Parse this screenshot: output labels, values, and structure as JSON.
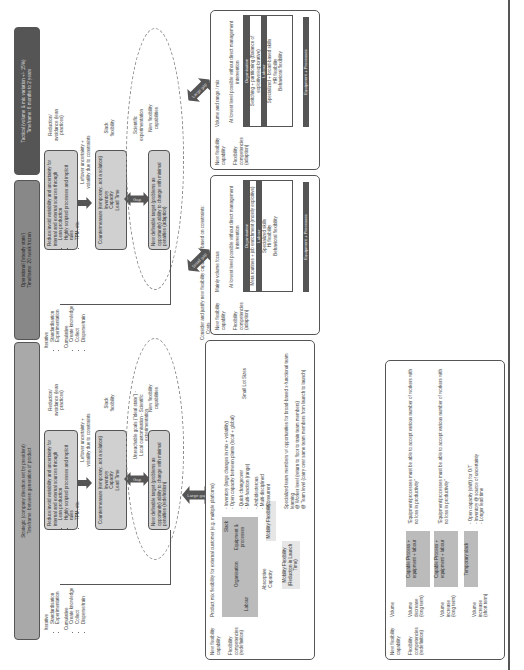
{
  "bands": {
    "strategic": "Strategic (company direction set by president)\nTimeframe: between generation of product",
    "operational": "Operational ('steady state')\nTimeframe: 20 week frozen",
    "tactical": "Tactical (volume & mix variation +/- 15%)\nTimeframe: 6 months to 2 years"
  },
  "strategic_flow": {
    "reduce_box": {
      "title": "Reduce/avoid variability and uncertainty for internal and external sources through",
      "items": [
        "Lean production",
        "Highly scripted processes and implicit rules",
        "TPM, etc."
      ]
    },
    "reduction_label": "Reduction/ avoidance (lean practices)",
    "leftover_label": "Leftover uncertainty + volatility due to constraints",
    "counter_box": {
      "title": "Countermeasure (temporary...not a solution)",
      "items": [
        "Inventory",
        "Capacity",
        "Lead Time"
      ]
    },
    "slack_label": "Slack flexibility",
    "gap_label": "Gap",
    "unreachable_label": "Unreachable goals (\"ideal state\") - Local customisation - Scientific experimentation",
    "new_target_box": "New definable target (problems as opportunity) ability to change with minimal penalties (redefinition)",
    "new_capabilities_label": "New flexibility capabilities",
    "iterative_label": {
      "title": "Iterative",
      "items": [
        "Standardisation",
        "Experimentation"
      ]
    },
    "cumulative_label": {
      "title": "Cumulative",
      "items": [
        "Create knowledge",
        "Collect",
        "Disperse/train"
      ]
    }
  },
  "operational_flow": {
    "reduce_box": {
      "title": "Reduce/avoid variability and uncertainty for internal and external sources through",
      "items": [
        "Lean production",
        "Highly scripted processes and implicit rules",
        "TPM, etc."
      ]
    },
    "reduction_label": "Reduction/ avoidance (lean practices)",
    "leftover_label": "Leftover uncertainty + volatility due to constraints",
    "counter_box": {
      "title": "Countermeasure (temporary...not a solution)",
      "items": [
        "Inventory",
        "Capacity",
        "Lead Time"
      ]
    },
    "slack_label": "Slack flexibility",
    "gap_label": "Gap",
    "scientific_label": "Scientific experimentation",
    "new_target_box": "New definable target (problems as opportunity) ability to change with minimal penalties (adaption)",
    "new_capabilities_label": "New flexibility capabilities",
    "iterative_label": {
      "title": "Iterative",
      "items": [
        "Standardisation",
        "Experimentation"
      ]
    },
    "cumulative_label": {
      "title": "Cumulative",
      "items": [
        "Create knowledge",
        "Collect",
        "Disperse/train"
      ]
    }
  },
  "consider": {
    "title": "Consider and justify new flexibility capabilities based on constraints:",
    "items": [
      "Costs",
      "Resources",
      "Production Performance",
      "Timing"
    ]
  },
  "gaps": {
    "large1": "Large gap",
    "small": "Small gap",
    "large2": "Large gap"
  },
  "strategic_panel": {
    "cap_label": "New flexibility capability",
    "comp_label": "Flexibility competencies (redefinition)",
    "heading": "Product mix flexibility for external customer (e.g. multiple platforms)",
    "slack": "Slack",
    "equipment": "Equipment & processes",
    "organisation": "Organisation",
    "labour": "Labour",
    "absorptive": "Absorptive Capacity",
    "mobility1": "Mobility Flexibility",
    "mobility2": "Mobility Flexibility (Reduction in Launch Time)",
    "slack_items": [
      "- Inventory (large changes in mix + volatility)",
      "- Open capacity between plants (local + global)"
    ],
    "equip_items": [
      "- Quick changeover",
      "- Multi-function (range)"
    ],
    "small_lot": "Small Lot Sizes",
    "org_items": [
      "- Ambidexterous",
      "- Multi-disciplined",
      "- Consurrent"
    ],
    "labour_text": [
      "Specialized team members w/ opportunities for broad-based x-functional team learning",
      "@ Worker level (return to floor to train team members)",
      "@ Team level (carry over same team members from launch to launch)"
    ]
  },
  "operational_panel": {
    "cap_label": "New flexibility capability",
    "comp_label": "Flexibility competencies (adaption)",
    "heading": "Mainly volume focus",
    "intro": "At lowest level possible without direct management intervention",
    "org_hdr": "Organisation",
    "org_text": "Meta routines + job enrichment (mostly exploitive)",
    "lab_hdr": "Labour",
    "lab_text": [
      "Specialized skills",
      "Hi flexibility",
      "Behavioral flexibility"
    ],
    "bottom": "Equipment + Processes"
  },
  "tactical_panel": {
    "cap_label": "New flexibility capability",
    "comp_label": "Flexibility competencies (adaption)",
    "heading": "Volume and range / mix",
    "intro": "At lowest level possible without direct management intervention",
    "org_hdr": "Organisation",
    "org_text": "Switching + partitioning (Balance of exploitive/explorative)",
    "lab_hdr": "Labour",
    "lab_text": [
      "Specialized + broad-based skills",
      "HR flexibility",
      "Behavioral flexibility"
    ],
    "bottom": "Equipment + Processes"
  },
  "volume_panel": {
    "cap_label": "New flexibility capability",
    "comp_label": "Flexibility competencies (redefinition)",
    "heading": "Volume",
    "rows": [
      {
        "label": "Volume decrease (long term)",
        "box": "Capable Process + equipment + labour",
        "quote": "\"Equipment/processes must be able to accept various number of workers with no loss in productivity\""
      },
      {
        "label": "Volume increase (long term)",
        "box": "Capable Process + equipment + labour",
        "quote": "\"Equipment/processes must be able to accept various number of workers with no loss in productivity\""
      },
      {
        "label": "Volume increase (short term)",
        "box": "Temporary slack",
        "quote": "- Open capacity (shift) for O/T\n- Inventory @ source of uncertainty\n- Longer lead time"
      }
    ]
  }
}
